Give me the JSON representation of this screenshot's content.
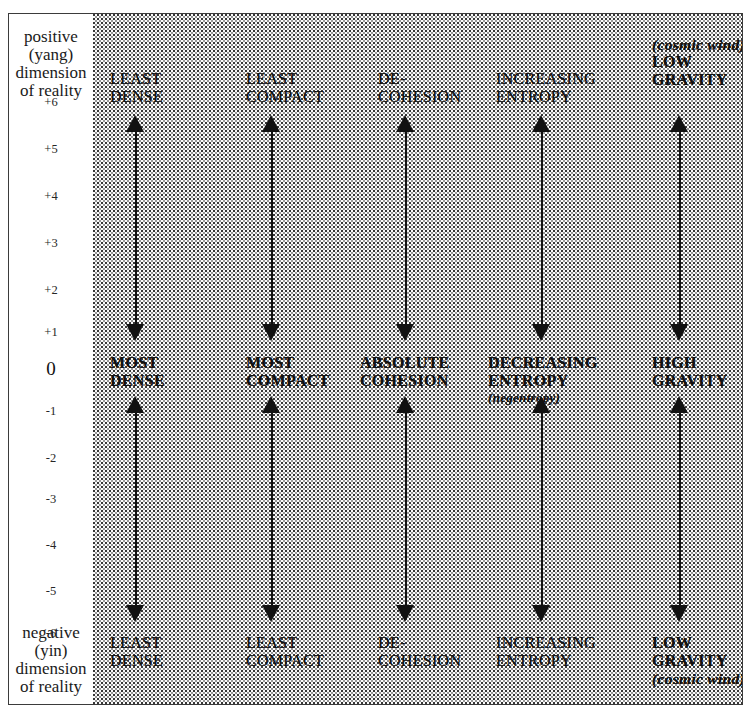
{
  "figure": {
    "axis": {
      "positive_caption": [
        "positive",
        "(yang)",
        "dimension",
        "of reality"
      ],
      "negative_caption": [
        "negative",
        "(yin)",
        "dimension",
        "of reality"
      ],
      "ticks": [
        "+6",
        "+5",
        "+4",
        "+3",
        "+2",
        "+1",
        "0",
        "-1",
        "-2",
        "-3",
        "-4",
        "-5",
        "-6"
      ]
    },
    "columns": [
      {
        "id": "density",
        "top_label": [
          "LEAST",
          "DENSE"
        ],
        "middle_label": [
          "MOST",
          "DENSE"
        ],
        "bottom_label": [
          "LEAST",
          "DENSE"
        ],
        "top_parenthetical": "",
        "bottom_parenthetical": "",
        "middle_sub": ""
      },
      {
        "id": "compactness",
        "top_label": [
          "LEAST",
          "COMPACT"
        ],
        "middle_label": [
          "MOST",
          "COMPACT"
        ],
        "bottom_label": [
          "LEAST",
          "COMPACT"
        ],
        "top_parenthetical": "",
        "bottom_parenthetical": "",
        "middle_sub": ""
      },
      {
        "id": "cohesion",
        "top_label": [
          "DE-",
          "COHESION"
        ],
        "middle_label": [
          "ABSOLUTE",
          "COHESION"
        ],
        "bottom_label": [
          "DE-",
          "COHESION"
        ],
        "top_parenthetical": "",
        "bottom_parenthetical": "",
        "middle_sub": ""
      },
      {
        "id": "entropy",
        "top_label": [
          "INCREASING",
          "ENTROPY"
        ],
        "middle_label": [
          "DECREASING",
          "ENTROPY"
        ],
        "bottom_label": [
          "INCREASING",
          "ENTROPY"
        ],
        "top_parenthetical": "",
        "bottom_parenthetical": "",
        "middle_sub": "(negentropy)"
      },
      {
        "id": "gravity",
        "top_label": [
          "LOW",
          "GRAVITY"
        ],
        "middle_label": [
          "HIGH",
          "GRAVITY"
        ],
        "bottom_label": [
          "LOW",
          "GRAVITY"
        ],
        "top_parenthetical": "(cosmic wind)",
        "bottom_parenthetical": "(cosmic wind)",
        "middle_sub": ""
      }
    ],
    "arrows": {
      "upper": {
        "description": "double-headed vertical arrow spanning +6 to 0"
      },
      "lower": {
        "description": "double-headed vertical arrow spanning 0 to -6"
      }
    },
    "colors": {
      "ink": "#111111",
      "frame": "#3b3b3b",
      "paper": "#ffffff"
    }
  }
}
